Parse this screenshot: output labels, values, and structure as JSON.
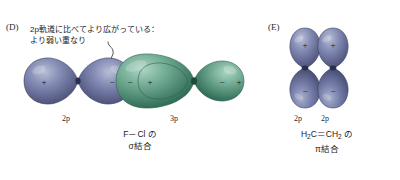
{
  "figure": {
    "background_color": "#ffffff",
    "panels": [
      {
        "letter": "(D)",
        "annotation_line1": "2p軌道に比べてより広がっている：",
        "annotation_line2": "より弱い重なり",
        "orbital_labels": {
          "left": "2p",
          "right": "3p"
        },
        "caption_line1": "F－Cl の",
        "caption_line2": "σ結合",
        "lobe_signs": {
          "p2_left": "+",
          "p2_right": "−",
          "p3_left_outer": "−",
          "p3_left_inner": "+",
          "p3_right_inner": "−",
          "p3_right_outer": "+"
        },
        "colors": {
          "orbital_2p": "#7b82ab",
          "orbital_2p_dark": "#4e5578",
          "orbital_3p": "#6aa790",
          "orbital_3p_dark": "#2f6a55"
        }
      },
      {
        "letter": "(E)",
        "orbital_labels": {
          "left": "2p",
          "right": "2p"
        },
        "caption_line1_prefix": "H",
        "caption_line1_sub1": "2",
        "caption_line1_mid": "C＝CH",
        "caption_line1_sub2": "2",
        "caption_line1_suffix": " の",
        "caption_line2": "π結合",
        "lobe_signs": {
          "left_top": "+",
          "right_top": "+",
          "left_bottom": "−",
          "right_bottom": "−"
        },
        "colors": {
          "orbital_2p": "#7b82ab",
          "orbital_2p_dark": "#4e5578"
        }
      }
    ]
  }
}
